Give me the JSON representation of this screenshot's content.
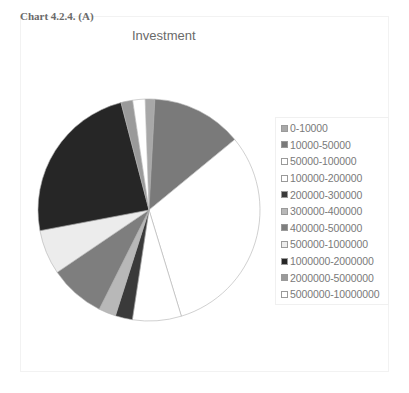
{
  "caption": "Chart 4.2.4. (A)",
  "chart_data": {
    "type": "pie",
    "title": "Investment",
    "categories": [
      "0-10000",
      "10000-50000",
      "50000-100000",
      "100000-200000",
      "200000-300000",
      "300000-400000",
      "400000-500000",
      "500000-1000000",
      "1000000-2000000",
      "2000000-5000000",
      "5000000-10000000"
    ],
    "values": [
      1.4,
      13.2,
      31.2,
      7.1,
      2.5,
      2.5,
      8.1,
      6.5,
      23.9,
      1.7,
      1.8
    ],
    "unit": "percent (estimated from slice angles)",
    "start_angle_deg": -2,
    "direction": "clockwise",
    "legend_position": "right"
  },
  "colors": [
    "#a8a8a8",
    "#7a7a7a",
    "#ffffff",
    "#ffffff",
    "#3a3a3a",
    "#b8b8b8",
    "#7e7e7e",
    "#ececec",
    "#262626",
    "#9a9a9a",
    "#ffffff"
  ],
  "legend": {
    "items": [
      {
        "label": "0-10000"
      },
      {
        "label": "10000-50000"
      },
      {
        "label": "50000-100000"
      },
      {
        "label": "100000-200000"
      },
      {
        "label": "200000-300000"
      },
      {
        "label": "300000-400000"
      },
      {
        "label": "400000-500000"
      },
      {
        "label": "500000-1000000"
      },
      {
        "label": "1000000-2000000"
      },
      {
        "label": "2000000-5000000"
      },
      {
        "label": "5000000-10000000"
      }
    ]
  }
}
